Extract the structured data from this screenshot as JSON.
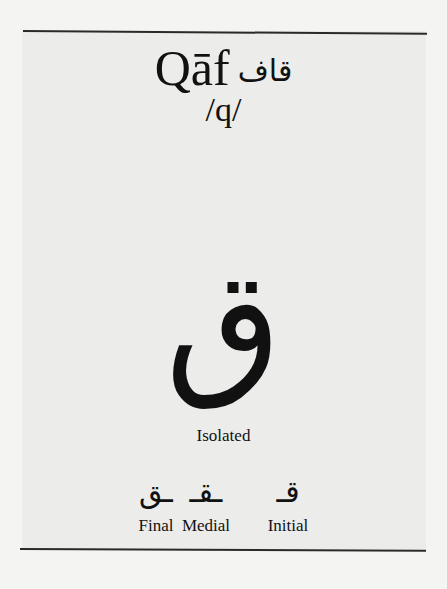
{
  "header": {
    "name_latin": "Qāf",
    "name_arabic": "قاف",
    "ipa": "/q/"
  },
  "isolated": {
    "glyph": "ق",
    "label": "Isolated"
  },
  "forms": [
    {
      "glyph": "ـق",
      "label": "Final"
    },
    {
      "glyph": "ـقـ",
      "label": "Medial"
    },
    {
      "glyph": "قـ",
      "label": "Initial"
    }
  ],
  "colors": {
    "background": "#f4f4f2",
    "panel": "#ececea",
    "ink": "#111111",
    "rule": "#2a2a2a"
  }
}
